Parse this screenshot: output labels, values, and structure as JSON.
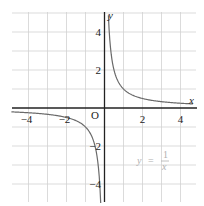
{
  "chart_data": {
    "type": "line",
    "title": "",
    "xlabel": "x",
    "ylabel": "y",
    "origin_label": "O",
    "xlim": [
      -5,
      5
    ],
    "ylim": [
      -5,
      5
    ],
    "grid": true,
    "grid_step": 1,
    "x_ticks": [
      -4,
      -2,
      2,
      4
    ],
    "x_tick_labels": [
      "−4",
      "−2",
      "2",
      "4"
    ],
    "y_ticks": [
      4,
      2,
      -2,
      -4
    ],
    "y_tick_labels": [
      "4",
      "2",
      "−2",
      "−4"
    ],
    "series": [
      {
        "name": "y = 1/x",
        "equation": "y = 1/x",
        "branches": [
          {
            "x": [
              0.2,
              0.25,
              0.33,
              0.5,
              0.75,
              1,
              1.5,
              2,
              3,
              4,
              4.6
            ],
            "y": [
              5,
              4,
              3,
              2,
              1.33,
              1,
              0.67,
              0.5,
              0.33,
              0.25,
              0.22
            ]
          },
          {
            "x": [
              -4.9,
              -4,
              -3,
              -2,
              -1.5,
              -1,
              -0.75,
              -0.5,
              -0.33,
              -0.25,
              -0.2
            ],
            "y": [
              -0.2,
              -0.25,
              -0.33,
              -0.5,
              -0.67,
              -1,
              -1.33,
              -2,
              -3,
              -4,
              -5
            ]
          }
        ]
      }
    ],
    "annotation": {
      "text": "y = 1/x",
      "lhs": "y",
      "eq": "=",
      "num": "1",
      "den": "x",
      "color": "#b0b0b0"
    }
  }
}
